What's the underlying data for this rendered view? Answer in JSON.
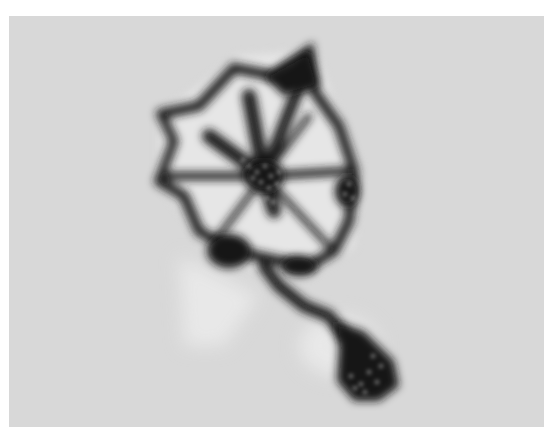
{
  "image": {
    "kind": "grayscale micrograph",
    "background_color": "#d8d8d8",
    "border_color": "#ffffff",
    "subject_color": "#141414",
    "subject": "dark stained cell-like specimen with radiating strands and a tail ending in a dark dotted blob"
  }
}
